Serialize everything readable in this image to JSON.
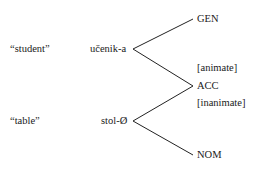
{
  "diagram": {
    "rows": [
      {
        "gloss": "“student”",
        "form": "učenik-a"
      },
      {
        "gloss": "“table”",
        "form": "stol-Ø"
      }
    ],
    "cases": {
      "gen": "GEN",
      "acc": "ACC",
      "nom": "NOM"
    },
    "features": {
      "animate": "[animate]",
      "inanimate": "[inanimate]"
    },
    "edges": [
      {
        "from": "učenik-a",
        "to": "GEN"
      },
      {
        "from": "učenik-a",
        "to": "ACC",
        "feature": "[animate]"
      },
      {
        "from": "stol-Ø",
        "to": "ACC",
        "feature": "[inanimate]"
      },
      {
        "from": "stol-Ø",
        "to": "NOM"
      }
    ]
  }
}
